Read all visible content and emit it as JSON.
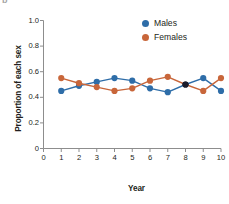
{
  "panel_label": "b",
  "chart_data": {
    "type": "line",
    "title": "",
    "subtitle": "",
    "xlabel": "Year",
    "ylabel": "Proportion of each sex",
    "x": [
      1,
      2,
      3,
      4,
      5,
      6,
      7,
      8,
      9,
      10
    ],
    "xlim": [
      0,
      10
    ],
    "ylim": [
      0,
      1.0
    ],
    "xticks": [
      0,
      1,
      2,
      3,
      4,
      5,
      6,
      7,
      8,
      9,
      10
    ],
    "xtick_labels": [
      "0",
      "1",
      "2",
      "3",
      "4",
      "5",
      "6",
      "7",
      "8",
      "9",
      "10"
    ],
    "yticks": [
      0,
      0.2,
      0.4,
      0.6,
      0.8,
      1.0
    ],
    "ytick_labels": [
      "0",
      "0.2",
      "0.4",
      "0.6",
      "0.8",
      "1.0"
    ],
    "grid": false,
    "legend_position": "top-right",
    "markers": "circle",
    "series": [
      {
        "name": "Males",
        "color": "#2E6DA8",
        "values": [
          0.45,
          0.49,
          0.52,
          0.55,
          0.53,
          0.47,
          0.44,
          0.5,
          0.55,
          0.45
        ]
      },
      {
        "name": "Females",
        "color": "#C8663A",
        "values": [
          0.55,
          0.51,
          0.48,
          0.45,
          0.47,
          0.53,
          0.56,
          0.5,
          0.45,
          0.55
        ]
      }
    ],
    "overlapping_points": [
      {
        "x": 8,
        "y": 0.5,
        "color": "#1b1b2b",
        "note": "Males and Females coincide"
      }
    ],
    "annotations": []
  },
  "axis_color": "#8d8d8d",
  "text_color": "#231f20"
}
